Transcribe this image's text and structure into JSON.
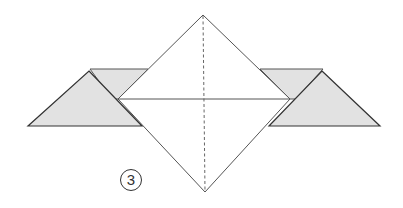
{
  "diagram": {
    "type": "origami-fold-step",
    "step_number": "3",
    "colors": {
      "paper_front": "#ffffff",
      "paper_back_shaded": "#e2e2e2",
      "line": "#444444",
      "fold_line": "#555555"
    },
    "elements": [
      "center diamond (square rotated 45°)",
      "vertical dashed valley-fold line through center",
      "horizontal line across diamond middle",
      "left shaded flap (triangle over parallelogram)",
      "right shaded flap (triangle over parallelogram)"
    ]
  }
}
